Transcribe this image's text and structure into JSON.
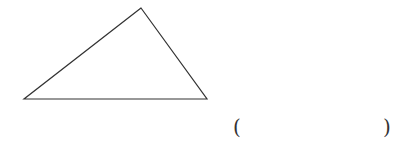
{
  "figure": {
    "type": "triangle",
    "stroke_color": "#333333",
    "stroke_width": 1.2,
    "vertices": {
      "top": [
        141,
        8
      ],
      "bottom_left": [
        24,
        99
      ],
      "bottom_right": [
        207,
        99
      ]
    }
  },
  "answer_blank": {
    "open_paren": "(",
    "close_paren": ")",
    "value": ""
  }
}
